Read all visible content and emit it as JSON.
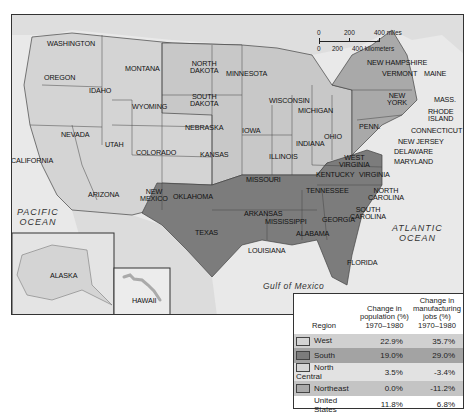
{
  "map": {
    "title": "Regional change in population and manufacturing jobs, 1970-1980",
    "scale": {
      "miles_ticks": [
        "0",
        "200",
        "400 miles"
      ],
      "km_ticks": [
        "0",
        "200",
        "400 kilometers"
      ]
    },
    "oceans": {
      "pacific": "PACIFIC\nOCEAN",
      "atlantic": "ATLANTIC\nOCEAN",
      "gulf": "Gulf of Mexico"
    },
    "states": {
      "washington": "WASHINGTON",
      "oregon": "OREGON",
      "california": "CALIFORNIA",
      "idaho": "IDAHO",
      "nevada": "NEVADA",
      "montana": "MONTANA",
      "wyoming": "WYOMING",
      "utah": "UTAH",
      "colorado": "COLORADO",
      "arizona": "ARIZONA",
      "new_mexico": "NEW\nMEXICO",
      "north_dakota": "NORTH\nDAKOTA",
      "south_dakota": "SOUTH\nDAKOTA",
      "nebraska": "NEBRASKA",
      "kansas": "KANSAS",
      "oklahoma": "OKLAHOMA",
      "texas": "TEXAS",
      "minnesota": "MINNESOTA",
      "iowa": "IOWA",
      "missouri": "MISSOURI",
      "arkansas": "ARKANSAS",
      "louisiana": "LOUISIANA",
      "wisconsin": "WISCONSIN",
      "illinois": "ILLINOIS",
      "michigan": "MICHIGAN",
      "indiana": "INDIANA",
      "ohio": "OHIO",
      "kentucky": "KENTUCKY",
      "tennessee": "TENNESSEE",
      "mississippi": "MISSISSIPPI",
      "alabama": "ALABAMA",
      "georgia": "GEORGIA",
      "florida": "FLORIDA",
      "south_carolina": "SOUTH\nCAROLINA",
      "north_carolina": "NORTH\nCAROLINA",
      "virginia": "VIRGINIA",
      "west_virginia": "WEST\nVIRGINIA",
      "maryland": "MARYLAND",
      "delaware": "DELAWARE",
      "new_jersey": "NEW JERSEY",
      "penn": "PENN.",
      "new_york": "NEW\nYORK",
      "connecticut": "CONNECTICUT",
      "rhode_island": "RHODE\nISLAND",
      "mass": "MASS.",
      "vermont": "VERMONT",
      "new_hampshire": "NEW HAMPSHIRE",
      "maine": "MAINE",
      "alaska": "ALASKA",
      "hawaii": "HAWAII"
    },
    "region_colors": {
      "West": "#d4d4d4",
      "South": "#7c7c7c",
      "North Central": "#c6c6c6",
      "Northeast": "#a9a9a9",
      "water": "#eeeeee",
      "outside": "#dcdcdc"
    }
  },
  "table": {
    "headers": {
      "region": "Region",
      "population": "Change in\npopulation (%)\n1970–1980",
      "manufacturing": "Change in\nmanufacturing\njobs (%)\n1970–1980"
    },
    "rows": [
      {
        "region": "West",
        "population": "22.9%",
        "manufacturing": "35.7%",
        "swatch": "#d4d4d4",
        "bg": "#d0d0d0"
      },
      {
        "region": "South",
        "population": "19.0%",
        "manufacturing": "29.0%",
        "swatch": "#7c7c7c",
        "bg": "#a3a3a3"
      },
      {
        "region": "North Central",
        "population": "3.5%",
        "manufacturing": "-3.4%",
        "swatch": "#d6d6d6",
        "bg": "#e2e2e2"
      },
      {
        "region": "Northeast",
        "population": "0.0%",
        "manufacturing": "-11.2%",
        "swatch": "#a9a9a9",
        "bg": "#c4c4c4"
      }
    ],
    "total": {
      "region": "United States",
      "population": "11.8%",
      "manufacturing": "6.8%"
    }
  }
}
